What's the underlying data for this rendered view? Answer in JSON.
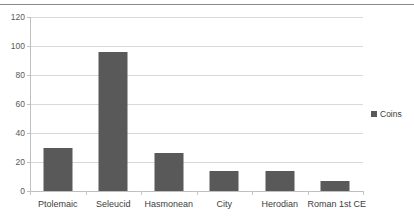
{
  "chart_data": {
    "type": "bar",
    "title": "",
    "subtitle": "",
    "xlabel": "",
    "ylabel": "",
    "categories": [
      "Ptolemaic",
      "Seleucid",
      "Hasmonean",
      "City",
      "Herodian",
      "Roman 1st CE"
    ],
    "series": [
      {
        "name": "Coins",
        "values": [
          30,
          96,
          26,
          14,
          14,
          7
        ],
        "color": "#595959"
      }
    ],
    "ylim": [
      0,
      120
    ],
    "yticks": [
      0,
      20,
      40,
      60,
      80,
      100,
      120
    ],
    "ytick_labels": [
      "0",
      "20",
      "40",
      "60",
      "80",
      "100",
      "120"
    ],
    "grid": true,
    "grid_axis": "y",
    "legend": {
      "position": "right",
      "entries": [
        {
          "label": "Coins",
          "color": "#595959",
          "marker": "square-marker"
        }
      ]
    },
    "colors": {
      "bar": "#595959",
      "gridline": "#d9d9d9",
      "axis": "#bfbfbf",
      "tick_label": "#595959",
      "category_label": "#3d3d3d",
      "background": "#ffffff"
    }
  }
}
